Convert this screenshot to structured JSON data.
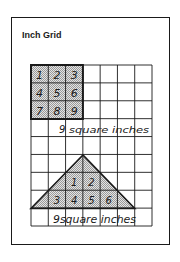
{
  "title": "Inch Grid",
  "grid": {
    "columns": 7,
    "rows": 9,
    "unit": "inch",
    "line_color": "#1a1a1a",
    "shade_color": "#c8c8c8"
  },
  "square_figure": {
    "shape": "square",
    "size": "3x3",
    "cell_labels": [
      "1",
      "2",
      "3",
      "4",
      "5",
      "6",
      "7",
      "8",
      "9"
    ],
    "caption_number": "9",
    "caption_text": "square inches"
  },
  "triangle_figure": {
    "shape": "triangle",
    "inner_labels_row1": [
      "1",
      "2"
    ],
    "inner_labels_row2": [
      "3",
      "4",
      "5",
      "6"
    ],
    "caption": "9square inches"
  }
}
